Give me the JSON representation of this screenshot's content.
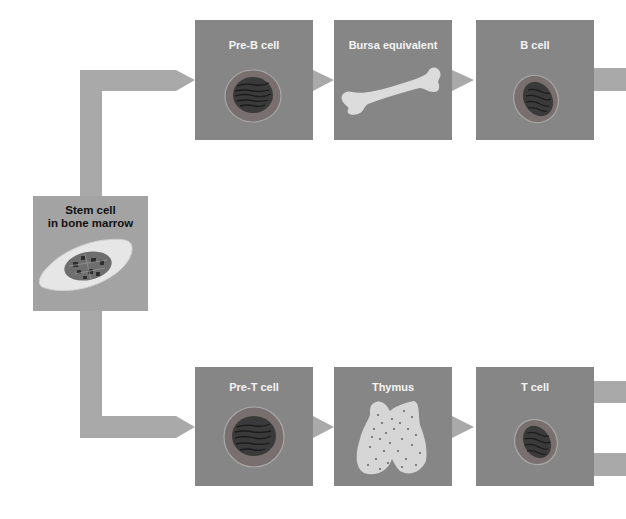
{
  "diagram": {
    "title": "",
    "colors": {
      "background": "#ffffff",
      "connector": "#a9a9a9",
      "box_dark": "#868686",
      "box_stem": "#a3a3a3",
      "label_light": "#f4f4f4",
      "label_dark": "#111111"
    },
    "stem": {
      "label_line1": "Stem cell",
      "label_line2": "in bone marrow"
    },
    "b_lineage": [
      {
        "label": "Pre-B cell",
        "icon": "cell-icon"
      },
      {
        "label": "Bursa equivalent",
        "icon": "bone-icon"
      },
      {
        "label": "B cell",
        "icon": "cell-icon"
      }
    ],
    "t_lineage": [
      {
        "label": "Pre-T cell",
        "icon": "cell-icon"
      },
      {
        "label": "Thymus",
        "icon": "thymus-icon"
      },
      {
        "label": "T cell",
        "icon": "cell-icon"
      }
    ],
    "outputs": {
      "b_cell_exits": 1,
      "t_cell_exits": 2
    }
  }
}
